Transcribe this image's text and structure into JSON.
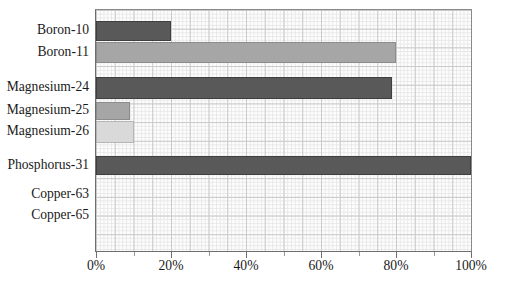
{
  "chart_data": {
    "type": "bar",
    "orientation": "horizontal",
    "title": "",
    "xlabel": "",
    "ylabel": "",
    "xlim": [
      0,
      100
    ],
    "grid": true,
    "legend": "none",
    "xtick_labels": [
      "0%",
      "20%",
      "40%",
      "60%",
      "80%",
      "100%"
    ],
    "xtick_values": [
      0,
      20,
      40,
      60,
      80,
      100
    ],
    "categories": [
      "Boron-10",
      "Boron-11",
      "Magnesium-24",
      "Magnesium-25",
      "Magnesium-26",
      "Phosphorus-31",
      "Copper-63",
      "Copper-65"
    ],
    "values": [
      20,
      80,
      79,
      9,
      10,
      100,
      0,
      0
    ],
    "bar_shades": [
      "dark",
      "medium",
      "dark",
      "medium",
      "light",
      "dark",
      "none",
      "none"
    ],
    "colors": {
      "dark": "#595959",
      "medium": "#a6a6a6",
      "light": "#d9d9d9",
      "grid_major": "#c9c9c9",
      "grid_minor": "#e8e8e8",
      "axis": "#6e6e6e",
      "text": "#1a1a1a",
      "background": "#ffffff"
    }
  },
  "rows": [
    {
      "label": "Boron-10",
      "value": 20,
      "shade": "dark"
    },
    {
      "label": "Boron-11",
      "value": 80,
      "shade": "medium"
    },
    {
      "label": "Magnesium-24",
      "value": 79,
      "shade": "dark"
    },
    {
      "label": "Magnesium-25",
      "value": 9,
      "shade": "medium"
    },
    {
      "label": "Magnesium-26",
      "value": 10,
      "shade": "light"
    },
    {
      "label": "Phosphorus-31",
      "value": 100,
      "shade": "dark"
    },
    {
      "label": "Copper-63",
      "value": 0,
      "shade": "none"
    },
    {
      "label": "Copper-65",
      "value": 0,
      "shade": "none"
    }
  ],
  "xticks": [
    {
      "label": "0%",
      "value": 0
    },
    {
      "label": "20%",
      "value": 20
    },
    {
      "label": "40%",
      "value": 40
    },
    {
      "label": "60%",
      "value": 60
    },
    {
      "label": "80%",
      "value": 80
    },
    {
      "label": "100%",
      "value": 100
    }
  ]
}
